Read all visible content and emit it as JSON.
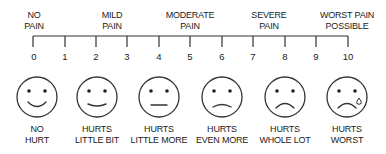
{
  "categories": [
    {
      "label_line1": "NO",
      "label_line2": "PAIN",
      "x": 34
    },
    {
      "label_line1": "MILD",
      "label_line2": "PAIN",
      "x": 112
    },
    {
      "label_line1": "MODERATE",
      "label_line2": "PAIN",
      "x": 190
    },
    {
      "label_line1": "SEVERE",
      "label_line2": "PAIN",
      "x": 269
    },
    {
      "label_line1": "WORST PAIN",
      "label_line2": "POSSIBLE",
      "x": 347
    }
  ],
  "scale": {
    "min": 0,
    "max": 10,
    "ticks": [
      "0",
      "1",
      "2",
      "3",
      "4",
      "5",
      "6",
      "7",
      "8",
      "9",
      "10"
    ],
    "line_color": "#333333"
  },
  "faces": [
    {
      "value": 0,
      "expression": "big-smile",
      "caption_line1": "NO",
      "caption_line2": "HURT"
    },
    {
      "value": 2,
      "expression": "smile",
      "caption_line1": "HURTS",
      "caption_line2": "LITTLE BIT"
    },
    {
      "value": 4,
      "expression": "neutral",
      "caption_line1": "HURTS",
      "caption_line2": "LITTLE MORE"
    },
    {
      "value": 6,
      "expression": "slight-frown",
      "caption_line1": "HURTS",
      "caption_line2": "EVEN MORE"
    },
    {
      "value": 8,
      "expression": "frown",
      "caption_line1": "HURTS",
      "caption_line2": "WHOLE LOT"
    },
    {
      "value": 10,
      "expression": "frown-tear",
      "caption_line1": "HURTS",
      "caption_line2": "WORST"
    }
  ]
}
